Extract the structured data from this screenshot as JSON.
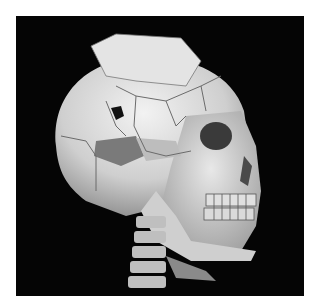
{
  "image": {
    "subject": "3D CT volume rendering of a human skull, lateral-oblique view, showing multiple comminuted cranial fractures and cervical spine",
    "background_color": "#050505",
    "frame_color": "#ffffff",
    "bone_color": "#d9d9d9",
    "fracture_line_color": "#6b6b6b"
  }
}
